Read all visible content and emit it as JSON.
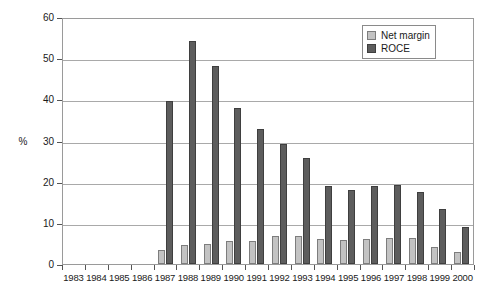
{
  "chart_data": {
    "type": "bar",
    "title": "",
    "subtitle": "",
    "xlabel": "",
    "ylabel": "%",
    "ylim": [
      0,
      60
    ],
    "ytick_step": 10,
    "yticks": [
      0,
      10,
      20,
      30,
      40,
      50,
      60
    ],
    "grid": true,
    "legend_position": "top-right",
    "categories": [
      "1983",
      "1984",
      "1985",
      "1986",
      "1987",
      "1988",
      "1989",
      "1990",
      "1991",
      "1992",
      "1993",
      "1994",
      "1995",
      "1996",
      "1997",
      "1998",
      "1999",
      "2000"
    ],
    "series": [
      {
        "name": "Net margin",
        "color": "#c3c3c3",
        "values": [
          null,
          null,
          null,
          null,
          3.4,
          4.7,
          4.8,
          5.6,
          5.6,
          6.7,
          6.8,
          6.0,
          5.9,
          6.0,
          6.3,
          6.2,
          4.2,
          3.0
        ]
      },
      {
        "name": "ROCE",
        "color": "#5d5d5d",
        "values": [
          null,
          null,
          null,
          null,
          39.6,
          54.2,
          48.0,
          37.8,
          32.7,
          29.1,
          25.7,
          19.0,
          18.0,
          19.0,
          19.1,
          17.4,
          13.3,
          9.0
        ]
      }
    ]
  },
  "legend": {
    "items": [
      {
        "label": "Net margin",
        "color": "#c3c3c3"
      },
      {
        "label": "ROCE",
        "color": "#5d5d5d"
      }
    ]
  },
  "axes": {
    "y_title": "%",
    "y_tick_labels": [
      "60",
      "50",
      "40",
      "30",
      "20",
      "10",
      "0"
    ]
  }
}
